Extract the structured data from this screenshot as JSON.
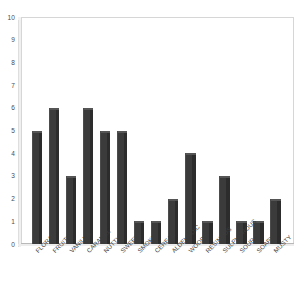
{
  "chart_data": {
    "type": "bar",
    "title": "",
    "subtitle": "",
    "xlabel": "",
    "ylabel": "",
    "ylim": [
      0,
      10
    ],
    "ytick_step": 1,
    "yticks": [
      10,
      9,
      8,
      7,
      6,
      5,
      4,
      3,
      2,
      1,
      0
    ],
    "grid": false,
    "legend": false,
    "legend_position": "none",
    "orientation": "vertical",
    "style": "3d-bars",
    "xtick_rotation_deg": -45,
    "categories": [
      "FLORAL",
      "FRUITY",
      "VANILLA",
      "CARAMEL",
      "NUTTY",
      "SWEET",
      "SMOKY",
      "CEREAL",
      "ALDEHYDIC",
      "WOODY",
      "RESINOUS",
      "SULPHUROUS",
      "SOUR",
      "SOAPY",
      "MUSTY"
    ],
    "values": [
      5,
      6,
      3,
      6,
      5,
      5,
      1,
      1,
      2,
      4,
      1,
      3,
      1,
      1,
      2
    ],
    "series": [
      {
        "name": "",
        "values": [
          5,
          6,
          3,
          6,
          5,
          5,
          1,
          1,
          2,
          4,
          1,
          3,
          1,
          1,
          2
        ]
      }
    ]
  },
  "colors": {
    "bar_fill": "#3a3a3a",
    "bar_highlight": "#4c4c4c",
    "bar_shadow": "#2c2c2c",
    "bar_top": "#555555",
    "plot_border": "#d6d6d6",
    "axis_line": "#b9b9b9",
    "background": "#ffffff",
    "tick_text": "#4a4a4a"
  }
}
